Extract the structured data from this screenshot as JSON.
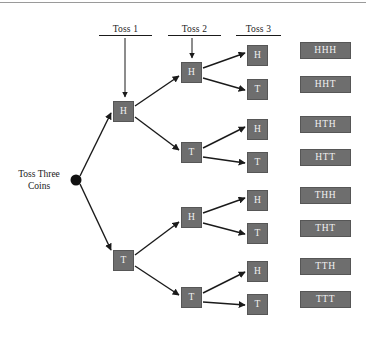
{
  "diagram": {
    "root": {
      "label_line1": "Toss Three",
      "label_line2": "Coins",
      "node_icon": "root-dot-icon",
      "x": 76,
      "y": 180
    },
    "stage_headers": [
      {
        "label": "Toss 1",
        "x": 99,
        "y": 24,
        "width": 53,
        "has_arrow": true
      },
      {
        "label": "Toss 2",
        "x": 168,
        "y": 24,
        "width": 53,
        "has_arrow": true
      },
      {
        "label": "Toss 3",
        "x": 236,
        "y": 24,
        "width": 45,
        "has_arrow": false
      }
    ],
    "level1_nodes": [
      {
        "label": "H",
        "x": 113,
        "y": 101
      },
      {
        "label": "T",
        "x": 113,
        "y": 250
      }
    ],
    "level2_nodes": [
      {
        "label": "H",
        "x": 181,
        "y": 62
      },
      {
        "label": "T",
        "x": 181,
        "y": 142
      },
      {
        "label": "H",
        "x": 181,
        "y": 207
      },
      {
        "label": "T",
        "x": 181,
        "y": 287
      }
    ],
    "level3_nodes": [
      {
        "label": "H",
        "x": 247,
        "y": 45
      },
      {
        "label": "T",
        "x": 247,
        "y": 79
      },
      {
        "label": "H",
        "x": 247,
        "y": 119
      },
      {
        "label": "T",
        "x": 247,
        "y": 152
      },
      {
        "label": "H",
        "x": 247,
        "y": 190
      },
      {
        "label": "T",
        "x": 247,
        "y": 223
      },
      {
        "label": "H",
        "x": 247,
        "y": 261
      },
      {
        "label": "T",
        "x": 247,
        "y": 294
      }
    ],
    "outcomes": [
      {
        "label": "HHH",
        "x": 300,
        "y": 42
      },
      {
        "label": "HHT",
        "x": 300,
        "y": 76
      },
      {
        "label": "HTH",
        "x": 300,
        "y": 116
      },
      {
        "label": "HTT",
        "x": 300,
        "y": 149
      },
      {
        "label": "THH",
        "x": 300,
        "y": 187
      },
      {
        "label": "THT",
        "x": 300,
        "y": 220
      },
      {
        "label": "TTH",
        "x": 300,
        "y": 258
      },
      {
        "label": "TTT",
        "x": 300,
        "y": 291
      }
    ],
    "colors": {
      "box_fill": "#6e6e6e",
      "box_border": "#565656",
      "box_text": "#f2f2f2",
      "line": "#1a1a1a",
      "label_text": "#1a1a1a",
      "background": "#ffffff",
      "top_rule": "#9a9a9a"
    },
    "edges": [
      {
        "from": "root",
        "to": "level1_H",
        "x1": 80,
        "y1": 176,
        "x2": 111,
        "y2": 113
      },
      {
        "from": "root",
        "to": "level1_T",
        "x1": 80,
        "y1": 184,
        "x2": 111,
        "y2": 250
      },
      {
        "from": "level1_H",
        "to": "level2_H",
        "x1": 135,
        "y1": 106,
        "x2": 179,
        "y2": 76
      },
      {
        "from": "level1_H",
        "to": "level2_T",
        "x1": 135,
        "y1": 116,
        "x2": 179,
        "y2": 150
      },
      {
        "from": "level1_T",
        "to": "level2_H",
        "x1": 135,
        "y1": 255,
        "x2": 179,
        "y2": 222
      },
      {
        "from": "level1_T",
        "to": "level2_T",
        "x1": 135,
        "y1": 265,
        "x2": 179,
        "y2": 295
      },
      {
        "from": "level2_H1",
        "to": "level3_H1",
        "x1": 203,
        "y1": 68,
        "x2": 245,
        "y2": 53
      },
      {
        "from": "level2_H1",
        "to": "level3_T1",
        "x1": 203,
        "y1": 77,
        "x2": 245,
        "y2": 90
      },
      {
        "from": "level2_T1",
        "to": "level3_H2",
        "x1": 203,
        "y1": 148,
        "x2": 245,
        "y2": 127
      },
      {
        "from": "level2_T1",
        "to": "level3_T2",
        "x1": 203,
        "y1": 157,
        "x2": 245,
        "y2": 163
      },
      {
        "from": "level2_H2",
        "to": "level3_H3",
        "x1": 203,
        "y1": 213,
        "x2": 245,
        "y2": 198
      },
      {
        "from": "level2_H2",
        "to": "level3_T3",
        "x1": 203,
        "y1": 222,
        "x2": 245,
        "y2": 234
      },
      {
        "from": "level2_T2",
        "to": "level3_H4",
        "x1": 203,
        "y1": 293,
        "x2": 245,
        "y2": 272
      },
      {
        "from": "level2_T2",
        "to": "level3_T4",
        "x1": 203,
        "y1": 302,
        "x2": 245,
        "y2": 305
      }
    ]
  }
}
